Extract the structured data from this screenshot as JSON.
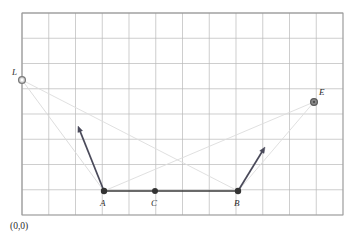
{
  "figure": {
    "origin_label": "(0,0)",
    "background_color": "#ffffff",
    "grid": {
      "visible": true,
      "line_color": "#b9b9b9",
      "border_color": "#9a9a9a",
      "x_start": 22,
      "y_start": 13,
      "x_end": 343,
      "y_end": 215,
      "cell_width": 26.75,
      "cell_height": 25.25,
      "columns": 12,
      "rows": 8
    },
    "points": [
      {
        "name": "L",
        "label": "L",
        "x": 22,
        "y": 80,
        "marker": "open-circle",
        "fill": "#d8d8d8",
        "stroke": "#7a7a7a",
        "radius": 3.4,
        "label_dx": -10,
        "label_dy": -12
      },
      {
        "name": "E",
        "label": "E",
        "x": 314,
        "y": 102,
        "marker": "filled-circle",
        "fill": "#8a8a8a",
        "stroke": "#5a5a5a",
        "radius": 3.4,
        "label_dx": 5,
        "label_dy": -14
      },
      {
        "name": "A",
        "label": "A",
        "x": 104,
        "y": 191,
        "marker": "dot",
        "fill": "#333333",
        "stroke": "#333333",
        "radius": 3.2,
        "label_dx": -4,
        "label_dy": 8
      },
      {
        "name": "C",
        "label": "C",
        "x": 155,
        "y": 191,
        "marker": "dot",
        "fill": "#333333",
        "stroke": "#333333",
        "radius": 3.0,
        "label_dx": -4,
        "label_dy": 8
      },
      {
        "name": "B",
        "label": "B",
        "x": 238,
        "y": 191,
        "marker": "dot",
        "fill": "#333333",
        "stroke": "#333333",
        "radius": 3.2,
        "label_dx": -4,
        "label_dy": 8
      }
    ],
    "segments": [
      {
        "name": "segment-AB",
        "x1": 104,
        "y1": 191,
        "x2": 238,
        "y2": 191,
        "stroke": "#3a3a3a",
        "width": 1.6
      }
    ],
    "vectors": [
      {
        "name": "vector-at-A",
        "x1": 104,
        "y1": 191,
        "x2": 78,
        "y2": 126,
        "stroke": "#4a4a5a",
        "width": 1.7,
        "head": 6
      },
      {
        "name": "vector-at-B",
        "x1": 238,
        "y1": 191,
        "x2": 265,
        "y2": 147,
        "stroke": "#4a4a5a",
        "width": 1.7,
        "head": 6
      }
    ],
    "rays": [
      {
        "name": "ray-L-to-A",
        "x1": 22,
        "y1": 80,
        "x2": 104,
        "y2": 191,
        "stroke": "#d9d9d9",
        "width": 0.9
      },
      {
        "name": "ray-L-to-B",
        "x1": 22,
        "y1": 80,
        "x2": 238,
        "y2": 191,
        "stroke": "#dcdcdc",
        "width": 0.9
      },
      {
        "name": "ray-A-to-E",
        "x1": 104,
        "y1": 191,
        "x2": 314,
        "y2": 102,
        "stroke": "#dcdcdc",
        "width": 0.9
      },
      {
        "name": "ray-B-to-E",
        "x1": 238,
        "y1": 191,
        "x2": 314,
        "y2": 102,
        "stroke": "#dcdcdc",
        "width": 0.9
      }
    ]
  }
}
